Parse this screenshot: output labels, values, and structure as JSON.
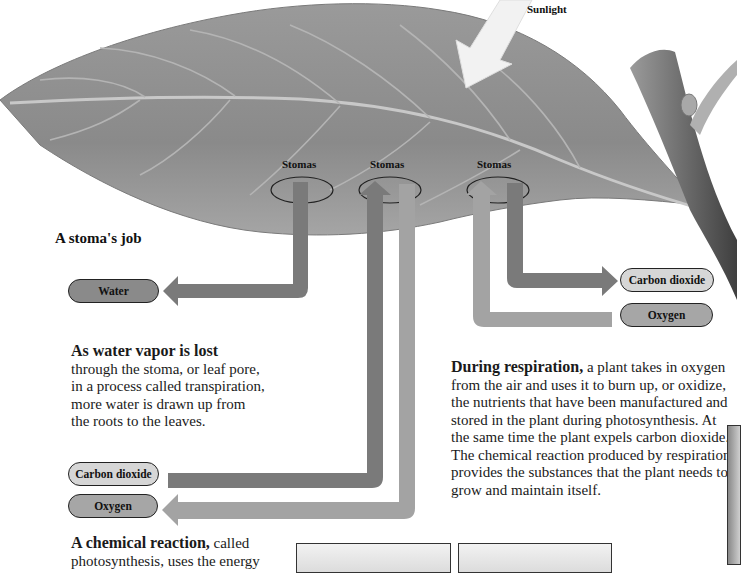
{
  "diagram": {
    "sunlight_label": "Sunlight",
    "stomas_labels": [
      "Stomas",
      "Stomas",
      "Stomas"
    ],
    "heading": "A stoma's job",
    "pills": {
      "water": "Water",
      "co2_left": "Carbon dioxide",
      "oxygen_left": "Oxygen",
      "co2_right": "Carbon dioxide",
      "oxygen_right": "Oxygen"
    },
    "transpiration": {
      "lead": "As water vapor is lost",
      "lines": [
        "through the stoma, or leaf pore,",
        "in a process called transpiration,",
        "more water is drawn up from",
        "the roots to the leaves."
      ]
    },
    "respiration": {
      "lead": "During respiration,",
      "lines": [
        " a plant takes in oxygen",
        "from the air and uses it to burn up, or oxidize,",
        "the nutrients that have been manufactured and",
        "stored in the plant during photosynthesis. At",
        "the same time the plant expels carbon dioxide.",
        "The chemical reaction produced by respiration",
        "provides the substances that the plant needs to",
        "grow and maintain itself."
      ]
    },
    "photosynthesis": {
      "lead": "A chemical reaction,",
      "rest": " called",
      "line2": "photosynthesis, uses the energy"
    },
    "colors": {
      "leaf": "#8e8e8e",
      "arrow_dark": "#7a7a7a",
      "arrow_light": "#a3a3a3",
      "pill_dark": "#8a8a8a",
      "pill_light": "#d6d6d6"
    }
  }
}
